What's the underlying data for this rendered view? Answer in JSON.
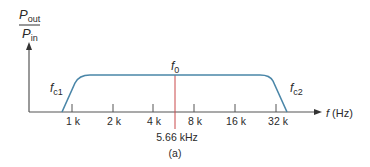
{
  "figure": {
    "caption": "(a)",
    "y_axis": {
      "numerator": "P",
      "numerator_sub": "out",
      "denominator": "P",
      "denominator_sub": "in"
    },
    "x_axis": {
      "var": "f",
      "unit": "(Hz)"
    },
    "ticks": [
      "1 k",
      "2 k",
      "4 k",
      "8 k",
      "16 k",
      "32 k"
    ],
    "center": {
      "label": "f",
      "sub": "0",
      "value_label": "5.66 kHz"
    },
    "cutoff_low": {
      "label": "f",
      "sub": "c1"
    },
    "cutoff_high": {
      "label": "f",
      "sub": "c2"
    },
    "colors": {
      "curve": "#4a86a8",
      "center_line": "#c9484a",
      "axis": "#555555",
      "text": "#2a2a2a"
    }
  }
}
